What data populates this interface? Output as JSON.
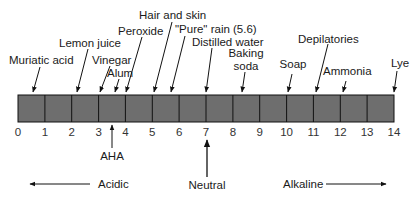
{
  "colors": {
    "bar_fill": "#6e6e6e",
    "bar_stroke": "#111111",
    "text": "#1a1a1a"
  },
  "scale": {
    "min": 0,
    "max": 14,
    "ticks": [
      "0",
      "1",
      "2",
      "3",
      "4",
      "5",
      "6",
      "7",
      "8",
      "9",
      "10",
      "11",
      "12",
      "13",
      "14"
    ]
  },
  "labels_above": [
    {
      "text": "Muriatic acid",
      "ph": 0.6
    },
    {
      "text": "Lemon juice",
      "ph": 2.2
    },
    {
      "text": "Vinegar",
      "ph": 3.0
    },
    {
      "text": "Alum",
      "ph": 3.5
    },
    {
      "text": "Peroxide",
      "ph": 4.0
    },
    {
      "text": "Hair and skin",
      "ph": 5.0
    },
    {
      "text": "\"Pure\" rain (5.6)",
      "ph": 5.6
    },
    {
      "text": "Distilled water",
      "ph": 7.0
    },
    {
      "text": "Baking",
      "ph": 8.3
    },
    {
      "text": "soda",
      "ph": 8.3
    },
    {
      "text": "Soap",
      "ph": 10.0
    },
    {
      "text": "Depilatories",
      "ph": 11.0
    },
    {
      "text": "Ammonia",
      "ph": 12.0
    },
    {
      "text": "Lye",
      "ph": 14.0
    }
  ],
  "labels_below": {
    "aha": "AHA",
    "neutral": "Neutral",
    "acidic": "Acidic",
    "alkaline": "Alkaline"
  }
}
